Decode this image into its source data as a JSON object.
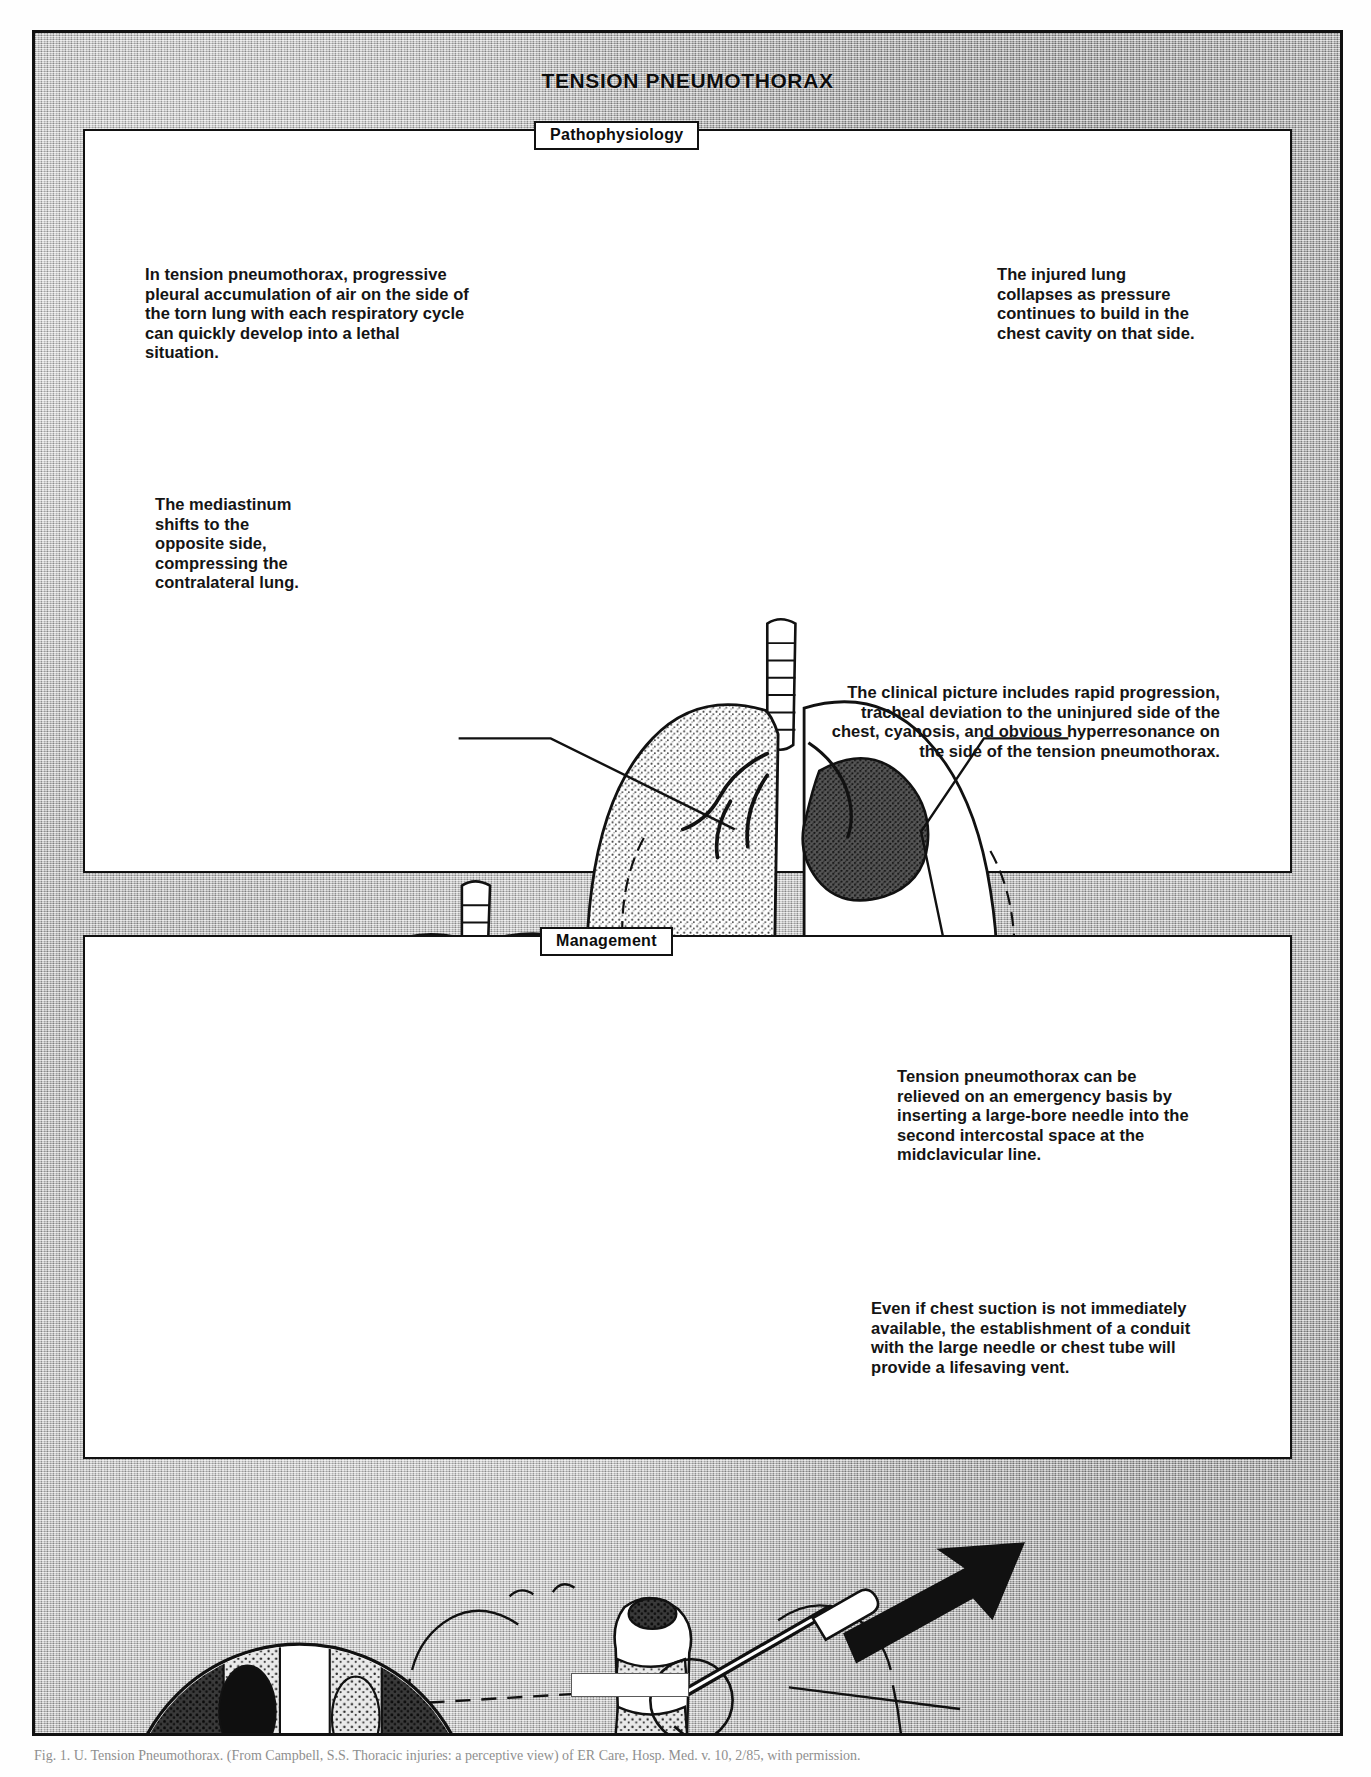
{
  "figure": {
    "title": "TENSION PNEUMOTHORAX",
    "caption": "Fig. 1. U. Tension Pneumothorax. (From Campbell, S.S. Thoracic injuries: a perceptive view) of ER Care, Hosp. Med. v. 10, 2/85, with permission."
  },
  "sections": {
    "pathophysiology": {
      "label": "Pathophysiology",
      "notes": {
        "progressive": "In tension pneumothorax, progressive pleural accumulation of air on the side of the torn lung with each respiratory cycle can quickly develop into a lethal situation.",
        "injured_lung": "The injured lung collapses as pressure continues to build in the chest cavity on that side.",
        "mediastinum": "The mediastinum shifts to the opposite side, compressing the contralateral lung.",
        "clinical_picture": "The clinical picture includes rapid progression, tracheal deviation to the uninjured side of the chest, cyanosis, and obvious hyperresonance on the side of the tension pneumothorax."
      }
    },
    "management": {
      "label": "Management",
      "notes": {
        "needle_decompression": "Tension pneumothorax can be relieved on an emergency basis by inserting a large-bore needle into the second intercostal space at the midclavicular line.",
        "conduit_vent": "Even if chest suction is not immediately available, the establishment of a conduit with the large needle or chest tube will provide a lifesaving vent."
      }
    }
  },
  "colors": {
    "ink": "#111111",
    "paper": "#ffffff",
    "scan_grey": "#b9b9b9"
  }
}
